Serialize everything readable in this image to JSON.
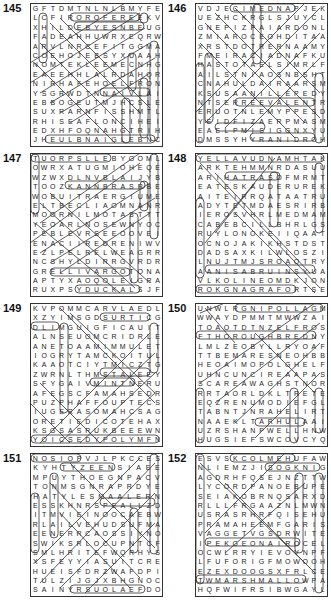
{
  "puzzles": [
    {
      "number": "145",
      "rows": [
        "GFTDMTNLNLBMYFE",
        "LCFIROROFEREEKV",
        "XHILDEBYESNBEUG",
        "FADEAHHUWRXEQRW",
        "ARVLNRCEFITGGMA",
        "COEHOJEBSYXUAAH",
        "NOMTEKLEEMECNHG",
        "EAEEHHLALRDAHQR",
        "NIRHAFEHOELFRON",
        "YSGRWDTNNAIVLAI",
        "EBBOGEUTMJHCSLE",
        "SUXRARNFISSHMTL",
        "RHISEAFLONCIHEI",
        "EDXHFOQNAHGTRIH",
        "JHEULBNAIGLEBNC"
      ]
    },
    {
      "number": "146",
      "rows": [
        "VDJECIMEDNAPJEK",
        "UEZHCKRGLSJUYCL",
        "GNEPIZPAIARDONL",
        "ZMIAROCEOHDITAA",
        "XRSTDOTRERNAAMY",
        "FMEIRACIADNAFKU",
        "HASTOTAELSIMRLF",
        "AILSTNIAOSNBSHT",
        "CNAHULDAIRAARSM",
        "KSUSAANILLEPEDYU",
        "NTSERREEVALENTR",
        "ERUOTNLEMYPPESD",
        "YEIDFIZAERPMASM",
        "EAELPMISIGGNXYU",
        "DMSSYHYRANIDROH"
      ]
    },
    {
      "number": "147",
      "rows": [
        "TUORPSLLEBYGOML",
        "OWRXATUGMIOHEQE",
        "WZWXDLNVBLAIJYB",
        "TOOZKANNBRASRBE",
        "WOBUITRAERGIUME",
        "ELTBECLIAOMNANR",
        "MOORNILMOTASTTT",
        "YEOARLNOSEWNYOC",
        "PEBLEVRSEEOOVEI",
        "ENACIIREDRENIWV",
        "EZLPELRELWEAGRR",
        "NCSHYLDIRRGVRDR",
        "GRELLIVARGOTONA",
        "APTYXAOQOLEIGRA",
        "RUXPSYDUCKALSJF"
      ]
    },
    {
      "number": "148",
      "rows": [
        "YELLAVUDNAMHTAK",
        "ARKTEHMMNRDASUU",
        "ARIHATRASOFMRMT",
        "EATESKAUDERUREK",
        "AITEIRRQATAATRU",
        "ADYTETMDAESRIRB",
        "IEROSVHRLMEDMAM",
        "CABEBCILLBHRLGSI",
        "RUYLONOKEIIQAAT",
        "OCNOJAKIKHSTDST",
        "DADSAXKILWLOSZI",
        "LNUJTMJSROAOTRY",
        "AANISABRUINSYUA",
        "VLKOLINEOMDKJON",
        "ROKGNAGRAFORTSE"
      ]
    },
    {
      "number": "149",
      "rows": [
        "KVPOMMCARVLAEDL",
        "XZYIMSGDSURTICG",
        "DLIMGUIGFICAUIT",
        "ALNSEUOMCRIDRLE",
        "ANETOAAMIMMULET",
        "IOGRYTAMCKOITUL",
        "KAAOTCIYTMICZTG",
        "ZWRNLTHMSTALEEY",
        "SFYGAIVMINTNERU",
        "AFEGSCFAMAHSEDR",
        "PUZPHAFFOUPTECS",
        "IUGERASOMAHCSAG",
        "ORETIEDICOTEHAX",
        "KSGSASRUKBEEEWN",
        "YOICSEDYPOLYMFN"
      ]
    },
    {
      "number": "150",
      "rows": [
        "UNWLRGNIPOLLAGM",
        "WWAYDPMMTMWWZAI",
        "TOAOTDTNZELFROS",
        "FTHOROUGHBREDNY",
        "LMLZEOBYLLRYOAF",
        "TTBEMARESNEOHBB",
        "HEOAIMOPOLGHELF",
        "UHNCUNCIREAAPAS",
        "SCAREAWAGHSTNOR",
        "RRTAORLDKLTRETE",
        "EQZRENUMODIEFGLH",
        "TABNTJNRAHELIRT",
        "NAAEKLTARHULAAI",
        "UZRSHANPWELLHNW",
        "HUGSIEFSWCOVCYQ"
      ]
    },
    {
      "number": "151",
      "rows": [
        "NOSIOPVJLPKCCES",
        "KYHTYZEENSIAEE",
        "MPUYTHOEGNPACV",
        "TONMSGNRAPRDYE",
        "HATYLESMAALERN",
        "ESSKHNRSPEALLZD",
        "ITMVIEINOOCAEBW",
        "RLAILVEHUDSUFMA",
        "EENERRCAOSSIYNOR",
        "SWIKSRLOCUPNTCF",
        "SMLHRITEFWQRHYS",
        "XSFEYYIASUITCREA",
        "HUEISFDRZWAFDPI",
        "TULZIJGJXBHGNOC",
        "SAINYRSUOLAEFDO"
      ]
    },
    {
      "number": "152",
      "rows": [
        "ESVSKCOLMEHUFAW",
        "NLIEMZJISOGKNIG",
        "AGDRHFQSEJNZTTW",
        "LYCORDPANOEBUPE",
        "SEIAKOBRNQSARXD",
        "RLLLFRGAAZNLMWN",
        "USRASRHRFQISEHU",
        "PRAMAHEEMFGARIS",
        "VAGGETVGSDRWITE",
        "IPEKGEONAIROCEL",
        "OCWLRRYIEVOVNPF",
        "LFUFORIGFMOWOOH",
        "EZEXDOOGSXFRLCE",
        "TWMARSHMALLOWPA",
        "HQFWIFRSIBWGAYL"
      ]
    }
  ]
}
